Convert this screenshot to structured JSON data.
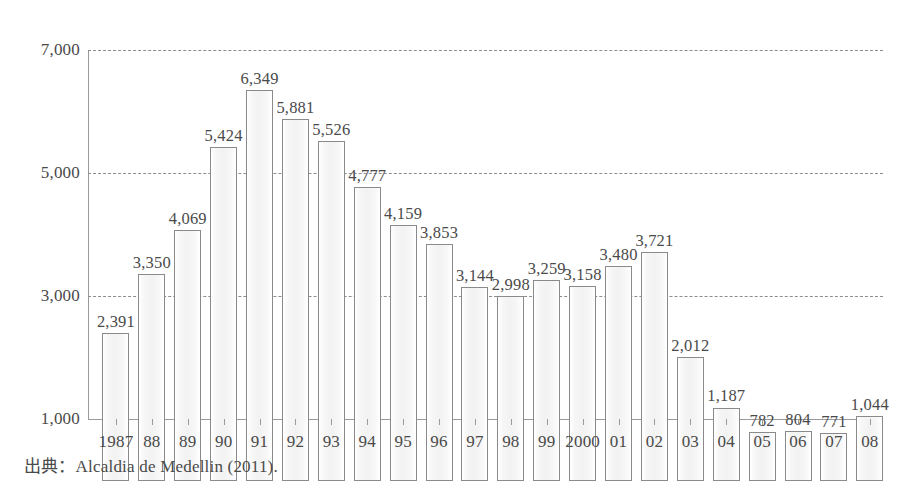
{
  "chart_data": {
    "type": "bar",
    "title": "",
    "subtitle": "",
    "xlabel": "",
    "ylabel": "",
    "categories": [
      "1987",
      "88",
      "89",
      "90",
      "91",
      "92",
      "93",
      "94",
      "95",
      "96",
      "97",
      "98",
      "99",
      "2000",
      "01",
      "02",
      "03",
      "04",
      "05",
      "06",
      "07",
      "08"
    ],
    "values": [
      2391,
      3350,
      4069,
      5424,
      6349,
      5881,
      5526,
      4777,
      4159,
      3853,
      3144,
      2998,
      3259,
      3158,
      3480,
      3721,
      2012,
      1187,
      782,
      804,
      771,
      1044
    ],
    "value_labels": [
      "2,391",
      "3,350",
      "4,069",
      "5,424",
      "6,349",
      "5,881",
      "5,526",
      "4,777",
      "4,159",
      "3,853",
      "3,144",
      "2,998",
      "3,259",
      "3,158",
      "3,480",
      "3,721",
      "2,012",
      "1,187",
      "782",
      "804",
      "771",
      "1,044"
    ],
    "ylim": [
      0,
      7000
    ],
    "ytick_values": [
      7000,
      5000,
      3000,
      1000
    ],
    "ytick_labels": [
      "7,000",
      "5,000",
      "3,000",
      "1,000"
    ],
    "grid": true,
    "grid_style": "dashed-horizontal",
    "legend": null,
    "baseline_value": 1000,
    "colors": {
      "bar_fill": "#f5f5f5",
      "bar_edge": "#8a8a8a",
      "axis": "#9a9a9a",
      "grid": "#8d8d8d",
      "text": "#4a4a4a",
      "background": "#ffffff"
    }
  },
  "source": {
    "text": "出典：Alcaldia de Medellin (2011)."
  }
}
